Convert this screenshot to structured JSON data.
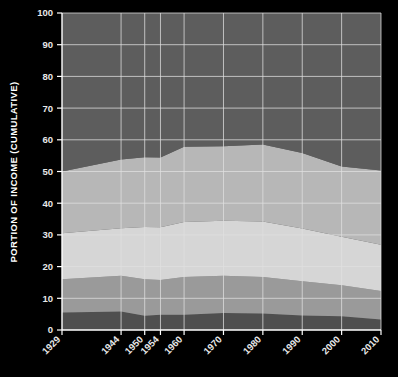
{
  "chart_data": {
    "type": "area",
    "stacked": true,
    "cumulative": true,
    "title": "",
    "subtitle": "",
    "xlabel": "",
    "ylabel": "PORTION OF INCOME (CUMULATIVE)",
    "x": [
      1929,
      1944,
      1950,
      1954,
      1960,
      1970,
      1980,
      1990,
      2000,
      2010
    ],
    "categories": [
      "1929",
      "1944",
      "1950",
      "1954",
      "1960",
      "1970",
      "1980",
      "1990",
      "2000",
      "2010"
    ],
    "xtick_labels": [
      "1929",
      "1944",
      "1950",
      "1954",
      "1960",
      "1970",
      "1980",
      "1990",
      "2000",
      "2010"
    ],
    "ytick_labels": [
      "0",
      "10",
      "20",
      "30",
      "40",
      "50",
      "60",
      "70",
      "80",
      "90",
      "100"
    ],
    "ytick_values": [
      0,
      10,
      20,
      30,
      40,
      50,
      60,
      70,
      80,
      90,
      100
    ],
    "ylim": [
      0,
      100
    ],
    "xlim": [
      1929,
      2010
    ],
    "grid": true,
    "legend": "none",
    "series": [
      {
        "name": "Lowest fifth",
        "color": "#4f4f4f",
        "values": [
          5.5,
          5.8,
          4.5,
          4.8,
          4.8,
          5.4,
          5.2,
          4.6,
          4.3,
          3.3
        ]
      },
      {
        "name": "Second fifth",
        "color": "#9a9a9a",
        "values": [
          10.5,
          11.3,
          11.5,
          11.0,
          11.9,
          11.7,
          11.5,
          10.8,
          9.8,
          9.0
        ]
      },
      {
        "name": "Middle fifth",
        "color": "#d6d6d6",
        "values": [
          14.5,
          15.0,
          16.5,
          16.6,
          17.4,
          17.4,
          17.5,
          16.6,
          15.3,
          14.6
        ]
      },
      {
        "name": "Fourth fifth",
        "color": "#b7b7b7",
        "values": [
          19.5,
          21.7,
          22.0,
          22.0,
          23.7,
          23.5,
          24.3,
          23.8,
          22.2,
          23.4
        ]
      },
      {
        "name": "Highest fifth",
        "color": "#5d5d5d",
        "values": [
          50.0,
          46.2,
          45.5,
          45.6,
          42.2,
          42.0,
          41.5,
          44.2,
          48.4,
          49.7
        ]
      }
    ],
    "cumulative_boundaries": [
      {
        "name": "top of lowest fifth",
        "values": [
          5.5,
          5.8,
          4.5,
          4.8,
          4.8,
          5.4,
          5.2,
          4.6,
          4.3,
          3.3
        ]
      },
      {
        "name": "top of second fifth",
        "values": [
          16.0,
          17.1,
          16.0,
          15.8,
          16.7,
          17.1,
          16.7,
          15.4,
          14.1,
          12.3
        ]
      },
      {
        "name": "top of middle fifth",
        "values": [
          30.5,
          32.1,
          32.5,
          32.4,
          34.1,
          34.5,
          34.2,
          32.0,
          29.4,
          26.9
        ]
      },
      {
        "name": "top of fourth fifth",
        "values": [
          50.0,
          53.8,
          54.5,
          54.4,
          57.8,
          58.0,
          58.5,
          55.8,
          51.6,
          50.3
        ]
      },
      {
        "name": "top of highest fifth",
        "values": [
          100,
          100,
          100,
          100,
          100,
          100,
          100,
          100,
          100,
          100
        ]
      }
    ],
    "colors": {
      "background": "#000000",
      "plot_background": "#5d5d5d",
      "axis": "#ffffff",
      "gridline": "#e0e0e0",
      "tick_label": "#e8e8e8",
      "axis_label": "#ffffff",
      "band_1": "#4f4f4f",
      "band_2": "#9a9a9a",
      "band_3": "#d6d6d6",
      "band_4": "#b7b7b7",
      "band_5": "#5d5d5d"
    }
  }
}
